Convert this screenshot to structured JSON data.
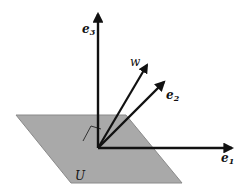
{
  "diagram": {
    "colors": {
      "plane_fill": "#a9a9a9",
      "plane_edge": "#8a8a8a",
      "vector": "#111111",
      "background": "#ffffff"
    },
    "plane": {
      "label": "U"
    },
    "vectors": [
      {
        "id": "e3",
        "label": "e",
        "subscript": "3"
      },
      {
        "id": "w",
        "label": "w",
        "subscript": ""
      },
      {
        "id": "e2",
        "label": "e",
        "subscript": "2"
      },
      {
        "id": "e1",
        "label": "e",
        "subscript": "1"
      }
    ],
    "right_angle_marker": true
  }
}
